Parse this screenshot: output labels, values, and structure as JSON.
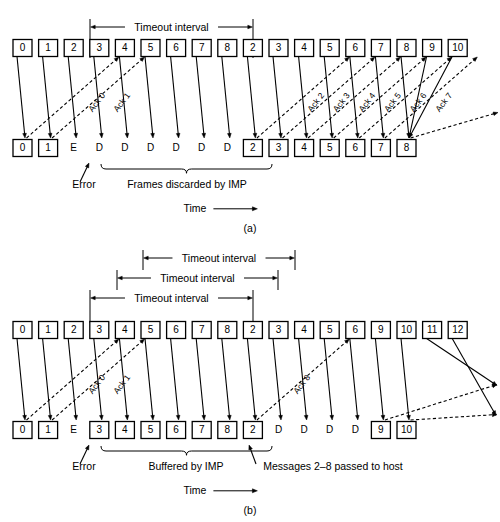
{
  "figure": {
    "time_axis_label": "Time"
  },
  "panels": [
    {
      "id": "a",
      "caption": "(a)",
      "timeout_brackets": [
        {
          "label": "Timeout interval",
          "x1": 90,
          "x2": 253,
          "y": 27
        }
      ],
      "sender_row": {
        "label": "sender-frames",
        "y": 48,
        "cells": [
          {
            "text": "0",
            "boxed": true
          },
          {
            "text": "1",
            "boxed": true
          },
          {
            "text": "2",
            "boxed": true
          },
          {
            "text": "3",
            "boxed": true
          },
          {
            "text": "4",
            "boxed": true
          },
          {
            "text": "5",
            "boxed": true
          },
          {
            "text": "6",
            "boxed": true
          },
          {
            "text": "7",
            "boxed": true
          },
          {
            "text": "8",
            "boxed": true
          },
          {
            "text": "2",
            "boxed": true
          },
          {
            "text": "3",
            "boxed": true
          },
          {
            "text": "4",
            "boxed": true
          },
          {
            "text": "5",
            "boxed": true
          },
          {
            "text": "6",
            "boxed": true
          },
          {
            "text": "7",
            "boxed": true
          },
          {
            "text": "8",
            "boxed": true
          },
          {
            "text": "9",
            "boxed": true
          },
          {
            "text": "10",
            "boxed": true
          }
        ]
      },
      "receiver_row": {
        "label": "receiver-frames",
        "y": 148,
        "cells": [
          {
            "text": "0",
            "boxed": true
          },
          {
            "text": "1",
            "boxed": true
          },
          {
            "text": "E",
            "boxed": false
          },
          {
            "text": "D",
            "boxed": false
          },
          {
            "text": "D",
            "boxed": false
          },
          {
            "text": "D",
            "boxed": false
          },
          {
            "text": "D",
            "boxed": false
          },
          {
            "text": "D",
            "boxed": false
          },
          {
            "text": "D",
            "boxed": false
          },
          {
            "text": "2",
            "boxed": true
          },
          {
            "text": "3",
            "boxed": true
          },
          {
            "text": "4",
            "boxed": true
          },
          {
            "text": "5",
            "boxed": true
          },
          {
            "text": "6",
            "boxed": true
          },
          {
            "text": "7",
            "boxed": true
          },
          {
            "text": "8",
            "boxed": true
          }
        ]
      },
      "ack_labels": [
        "Ack 0",
        "Ack 1",
        "Ack 2",
        "Ack 3",
        "Ack 4",
        "Ack 5",
        "Ack 6",
        "Ack 7"
      ],
      "annotations": [
        {
          "name": "error-label",
          "text": "Error",
          "x": 84,
          "y": 188
        },
        {
          "name": "discard-label",
          "text": "Frames discarded by IMP",
          "x": 187,
          "y": 188
        }
      ]
    },
    {
      "id": "b",
      "caption": "(b)",
      "timeout_brackets": [
        {
          "label": "Timeout interval",
          "x1": 143,
          "x2": 295,
          "y": 18
        },
        {
          "label": "Timeout interval",
          "x1": 117,
          "x2": 278,
          "y": 38
        },
        {
          "label": "Timeout interval",
          "x1": 90,
          "x2": 253,
          "y": 58
        }
      ],
      "sender_row": {
        "label": "sender-frames",
        "y": 90,
        "cells": [
          {
            "text": "0",
            "boxed": true
          },
          {
            "text": "1",
            "boxed": true
          },
          {
            "text": "2",
            "boxed": true
          },
          {
            "text": "3",
            "boxed": true
          },
          {
            "text": "4",
            "boxed": true
          },
          {
            "text": "5",
            "boxed": true
          },
          {
            "text": "6",
            "boxed": true
          },
          {
            "text": "7",
            "boxed": true
          },
          {
            "text": "8",
            "boxed": true
          },
          {
            "text": "2",
            "boxed": true
          },
          {
            "text": "3",
            "boxed": true
          },
          {
            "text": "4",
            "boxed": true
          },
          {
            "text": "5",
            "boxed": true
          },
          {
            "text": "6",
            "boxed": true
          },
          {
            "text": "9",
            "boxed": true
          },
          {
            "text": "10",
            "boxed": true
          },
          {
            "text": "11",
            "boxed": true
          },
          {
            "text": "12",
            "boxed": true
          }
        ]
      },
      "receiver_row": {
        "label": "receiver-frames",
        "y": 190,
        "cells": [
          {
            "text": "0",
            "boxed": true
          },
          {
            "text": "1",
            "boxed": true
          },
          {
            "text": "E",
            "boxed": false
          },
          {
            "text": "3",
            "boxed": true
          },
          {
            "text": "4",
            "boxed": true
          },
          {
            "text": "5",
            "boxed": true
          },
          {
            "text": "6",
            "boxed": true
          },
          {
            "text": "7",
            "boxed": true
          },
          {
            "text": "8",
            "boxed": true
          },
          {
            "text": "2",
            "boxed": true
          },
          {
            "text": "D",
            "boxed": false
          },
          {
            "text": "D",
            "boxed": false
          },
          {
            "text": "D",
            "boxed": false
          },
          {
            "text": "D",
            "boxed": false
          },
          {
            "text": "9",
            "boxed": true
          },
          {
            "text": "10",
            "boxed": true
          }
        ]
      },
      "ack_labels": [
        "Ack 0",
        "Ack 1",
        "Ack 8"
      ],
      "annotations": [
        {
          "name": "error-label",
          "text": "Error",
          "x": 84,
          "y": 230
        },
        {
          "name": "buffered-label",
          "text": "Buffered by IMP",
          "x": 186,
          "y": 230
        },
        {
          "name": "passed-label",
          "text": "Messages 2–8 passed to host",
          "x": 333,
          "y": 230
        }
      ]
    }
  ]
}
